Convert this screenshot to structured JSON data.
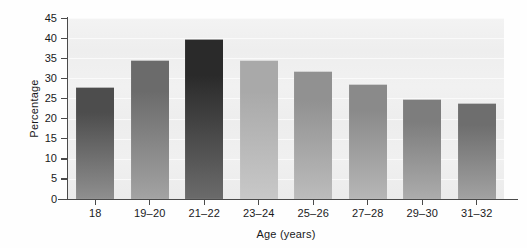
{
  "chart_data": {
    "type": "bar",
    "title": "",
    "xlabel": "Age (years)",
    "ylabel": "Percentage",
    "categories": [
      "18",
      "19–20",
      "21–22",
      "23–24",
      "25–26",
      "27–28",
      "29–30",
      "31–32"
    ],
    "values": [
      27.8,
      34.5,
      39.8,
      34.5,
      31.8,
      28.6,
      24.9,
      23.8
    ],
    "ylim": [
      0,
      45
    ],
    "yticks": [
      0,
      5,
      10,
      15,
      20,
      25,
      30,
      35,
      40,
      45
    ],
    "ytick_labels": [
      "0",
      "5",
      "10",
      "15",
      "20",
      "25",
      "30",
      "35",
      "40",
      "45"
    ],
    "grid": true,
    "grid_axis": "y",
    "legend": false,
    "legend_position": "none",
    "bar_colors_top": [
      "#4d4d4d",
      "#6b6b6b",
      "#2a2a2a",
      "#a9a9a9",
      "#919191",
      "#8a8a8a",
      "#7d7d7d",
      "#6e6e6e"
    ],
    "bar_colors_bottom": [
      "#8f8f8f",
      "#a3a3a3",
      "#6b6b6b",
      "#c8c8c8",
      "#bcbcbc",
      "#b6b6b6",
      "#acacac",
      "#a2a2a2"
    ],
    "plot_background": "#f0f0f0",
    "axis_color": "#4a4a4a",
    "text_color": "#19191b"
  }
}
